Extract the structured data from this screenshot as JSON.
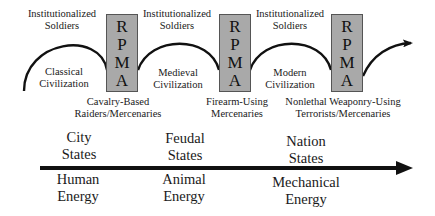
{
  "top_row": {
    "soldiers_labels": [
      {
        "line1": "Institutionalized",
        "line2": "Soldiers"
      },
      {
        "line1": "Institutionalized",
        "line2": "Soldiers"
      },
      {
        "line1": "Institutionalized",
        "line2": "Soldiers"
      }
    ],
    "civilizations": [
      {
        "line1": "Classical",
        "line2": "Civilization"
      },
      {
        "line1": "Medieval",
        "line2": "Civilization"
      },
      {
        "line1": "Modern",
        "line2": "Civilization"
      }
    ],
    "rpma_boxes": [
      {
        "letters": [
          "R",
          "P",
          "M",
          "A"
        ],
        "fill": "#a9a9a9"
      },
      {
        "letters": [
          "R",
          "P",
          "M",
          "A"
        ],
        "fill": "#a9a9a9"
      },
      {
        "letters": [
          "R",
          "P",
          "M",
          "A"
        ],
        "fill": "#a9a9a9"
      }
    ],
    "mercenary_labels": [
      {
        "line1": "Cavalry-Based",
        "line2": "Raiders/Mercenaries"
      },
      {
        "line1": "Firearm-Using",
        "line2": "Mercenaries"
      },
      {
        "line1": "Nonlethal Weaponry-Using",
        "line2": "Terrorists/Mercenaries"
      }
    ]
  },
  "timeline": {
    "states": [
      {
        "line1": "City",
        "line2": "States"
      },
      {
        "line1": "Feudal",
        "line2": "States"
      },
      {
        "line1": "Nation",
        "line2": "States"
      }
    ],
    "energy": [
      {
        "line1": "Human",
        "line2": "Energy"
      },
      {
        "line1": "Animal",
        "line2": "Energy"
      },
      {
        "line1": "Mechanical",
        "line2": "Energy"
      }
    ]
  }
}
